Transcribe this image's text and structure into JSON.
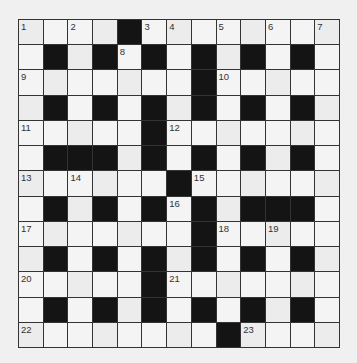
{
  "puzzle": {
    "type": "crossword",
    "rows": 13,
    "cols": 13,
    "colors": {
      "background": "#f0f0f0",
      "cell": "#f4f4f4",
      "block": "#141414",
      "gridline": "#333333",
      "number": "#333333"
    },
    "layout": [
      "....#........",
      ".#.#.#.#.#.#.",
      ".......#.....",
      ".#.#.#.#.#.#.",
      ".....#.......",
      ".###.#.#.#.#.",
      "......#......",
      ".#.#.#.#.###.",
      ".......#.....",
      ".#.#.#.#.#.#.",
      ".....#.......",
      ".#.#.#.#.#.#.",
      "........#...."
    ],
    "numbers": [
      {
        "n": "1",
        "row": 0,
        "col": 0
      },
      {
        "n": "2",
        "row": 0,
        "col": 2
      },
      {
        "n": "3",
        "row": 0,
        "col": 5
      },
      {
        "n": "4",
        "row": 0,
        "col": 6
      },
      {
        "n": "5",
        "row": 0,
        "col": 8
      },
      {
        "n": "6",
        "row": 0,
        "col": 10
      },
      {
        "n": "7",
        "row": 0,
        "col": 12
      },
      {
        "n": "8",
        "row": 1,
        "col": 4
      },
      {
        "n": "9",
        "row": 2,
        "col": 0
      },
      {
        "n": "10",
        "row": 2,
        "col": 8
      },
      {
        "n": "11",
        "row": 4,
        "col": 0
      },
      {
        "n": "12",
        "row": 4,
        "col": 6
      },
      {
        "n": "13",
        "row": 6,
        "col": 0
      },
      {
        "n": "14",
        "row": 6,
        "col": 2
      },
      {
        "n": "15",
        "row": 6,
        "col": 7
      },
      {
        "n": "16",
        "row": 7,
        "col": 6
      },
      {
        "n": "17",
        "row": 8,
        "col": 0
      },
      {
        "n": "18",
        "row": 8,
        "col": 8
      },
      {
        "n": "19",
        "row": 8,
        "col": 10
      },
      {
        "n": "20",
        "row": 10,
        "col": 0
      },
      {
        "n": "21",
        "row": 10,
        "col": 6
      },
      {
        "n": "22",
        "row": 12,
        "col": 0
      },
      {
        "n": "23",
        "row": 12,
        "col": 9
      }
    ]
  }
}
